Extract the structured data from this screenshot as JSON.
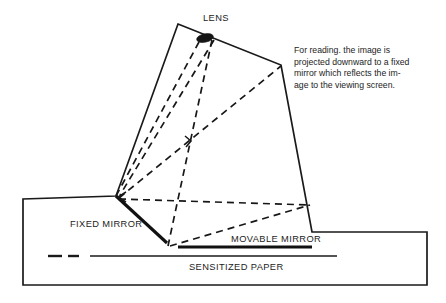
{
  "diagram": {
    "labels": {
      "lens": "LENS",
      "fixed_mirror": "FIXED MIRROR",
      "movable_mirror": "MOVABLE MIRROR",
      "sensitized_paper": "SENSITIZED PAPER"
    },
    "caption": {
      "full_text": "For reading. the image is projected downward to a fixed mirror which reflects the image to the viewing screen.",
      "lines": [
        "For  reading.  the  image  is",
        "projected downward to a fixed",
        "mirror which reflects the im-",
        "age  to  the  viewing  screen."
      ]
    },
    "colors": {
      "background": "#ffffff",
      "ink": "#1a1a1a",
      "mirror": "#111111",
      "ray": "#171717"
    },
    "geometry": {
      "camera_body_outline": "178,24 281,65 312,232 427,232 427,285 23,285 23,199 116,196",
      "fixed_mirror": "116,196 167,243",
      "movable_mirror": "178,247 312,247",
      "sensitized_paper_solid": "95,256 337,256",
      "sensitized_paper_dashes": "48,256 75,256",
      "lens_center": "205,38",
      "rays": [
        "205,38 116,196",
        "211,36 167,243",
        "199,41 116,196",
        "116,196 281,65",
        "116,196 310,205",
        "167,243 310,205"
      ]
    }
  }
}
